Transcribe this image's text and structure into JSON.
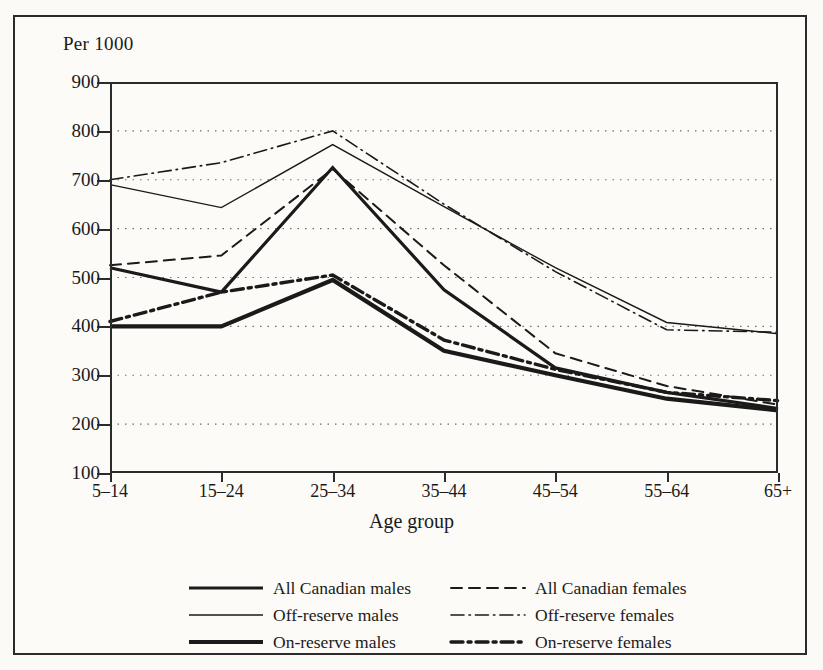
{
  "figure": {
    "unit_label": "Per 1000",
    "x_axis_title": "Age group",
    "frame_color": "#2b2b2b",
    "background": "#fcfbf8"
  },
  "chart_data": {
    "type": "line",
    "title": "",
    "subtitle": "",
    "xlabel": "Age group",
    "ylabel": "Per 1000",
    "ylim": [
      100,
      900
    ],
    "ytick_step": 100,
    "yticks": [
      900,
      800,
      700,
      600,
      500,
      400,
      300,
      200,
      100
    ],
    "grid": true,
    "grid_style": "dotted-horizontal",
    "legend_position": "below-plot",
    "categories": [
      "5–14",
      "15–24",
      "25–34",
      "35–44",
      "45–54",
      "55–64",
      "65+"
    ],
    "series": [
      {
        "name": "All Canadian males",
        "style": "solid",
        "width": 3.2,
        "color": "#1a1a1a",
        "values": [
          520,
          470,
          725,
          475,
          315,
          265,
          232
        ]
      },
      {
        "name": "All Canadian females",
        "style": "dashed",
        "width": 2.0,
        "color": "#1a1a1a",
        "values": [
          525,
          545,
          722,
          525,
          345,
          278,
          240
        ]
      },
      {
        "name": "Off-reserve males",
        "style": "solid",
        "width": 1.4,
        "color": "#1a1a1a",
        "values": [
          690,
          643,
          772,
          645,
          520,
          408,
          385
        ]
      },
      {
        "name": "Off-reserve females",
        "style": "dash-dot-thin",
        "width": 1.6,
        "color": "#1a1a1a",
        "values": [
          700,
          735,
          800,
          650,
          512,
          393,
          388
        ]
      },
      {
        "name": "On-reserve males",
        "style": "solid",
        "width": 4.2,
        "color": "#1a1a1a",
        "values": [
          400,
          400,
          495,
          350,
          300,
          252,
          228
        ]
      },
      {
        "name": "On-reserve females",
        "style": "dash-dot-thick",
        "width": 3.4,
        "color": "#1a1a1a",
        "values": [
          410,
          470,
          505,
          372,
          312,
          265,
          248
        ]
      }
    ]
  },
  "legend": {
    "rows": [
      {
        "left_label": "All Canadian males",
        "right_label": "All Canadian females"
      },
      {
        "left_label": "Off-reserve males",
        "right_label": "Off-reserve females"
      },
      {
        "left_label": "On-reserve males",
        "right_label": "On-reserve females"
      }
    ]
  }
}
